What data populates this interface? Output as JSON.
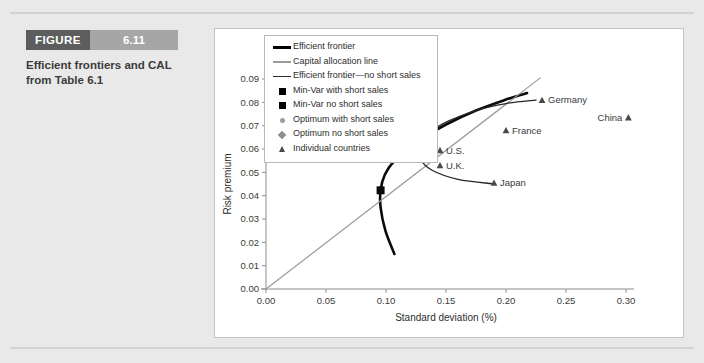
{
  "figure": {
    "banner_label": "FIGURE",
    "banner_number": "6.11",
    "caption": "Efficient frontiers and CAL from Table 6.1"
  },
  "chart_data": {
    "type": "scatter",
    "title": "",
    "xlabel": "Standard deviation (%)",
    "ylabel": "Risk premium",
    "xlim": [
      0.0,
      0.3
    ],
    "ylim": [
      0.0,
      0.09
    ],
    "xticks": [
      "0.00",
      "0.05",
      "0.10",
      "0.15",
      "0.20",
      "0.25",
      "0.30"
    ],
    "xtick_values": [
      0.0,
      0.05,
      0.1,
      0.15,
      0.2,
      0.25,
      0.3
    ],
    "yticks": [
      "0.00",
      "0.01",
      "0.02",
      "0.03",
      "0.04",
      "0.05",
      "0.06",
      "0.07",
      "0.08",
      "0.09"
    ],
    "ytick_values": [
      0.0,
      0.01,
      0.02,
      0.03,
      0.04,
      0.05,
      0.06,
      0.07,
      0.08,
      0.09
    ],
    "grid": false,
    "legend_position": "upper-left-inside",
    "legend": [
      {
        "label": "Efficient frontier",
        "key": "line-thick",
        "color": "#000000"
      },
      {
        "label": "Capital allocation line",
        "key": "line-thin",
        "color": "#9a9a9a"
      },
      {
        "label": "Efficient frontier—no short sales",
        "key": "line-mid",
        "color": "#2b2b2b"
      },
      {
        "label": "Min-Var with short sales",
        "key": "square",
        "color": "#000000"
      },
      {
        "label": "Min-Var no short sales",
        "key": "square",
        "color": "#000000"
      },
      {
        "label": "Optimum with short sales",
        "key": "circle",
        "color": "#9e9e9e"
      },
      {
        "label": "Optimum no short sales",
        "key": "diamond",
        "color": "#8e8e8e"
      },
      {
        "label": "Individual countries",
        "key": "triangle",
        "color": "#4a4a4a"
      }
    ],
    "series": [
      {
        "name": "Individual countries",
        "marker": "triangle",
        "points": [
          {
            "label": "U.S.",
            "x": 0.145,
            "y": 0.0595,
            "label_side": "right"
          },
          {
            "label": "U.K.",
            "x": 0.145,
            "y": 0.053,
            "label_side": "right"
          },
          {
            "label": "Japan",
            "x": 0.19,
            "y": 0.0455,
            "label_side": "right"
          },
          {
            "label": "France",
            "x": 0.2,
            "y": 0.068,
            "label_side": "right"
          },
          {
            "label": "Germany",
            "x": 0.23,
            "y": 0.081,
            "label_side": "right"
          },
          {
            "label": "China",
            "x": 0.302,
            "y": 0.0735,
            "label_side": "left"
          }
        ]
      },
      {
        "name": "Min-Var with short sales",
        "marker": "square",
        "points": [
          {
            "label": "",
            "x": 0.0955,
            "y": 0.0423
          }
        ]
      },
      {
        "name": "Min-Var no short sales",
        "marker": "square",
        "points": [
          {
            "label": "",
            "x": 0.1265,
            "y": 0.0558
          }
        ]
      },
      {
        "name": "Optimum with short sales",
        "marker": "circle",
        "points": [
          {
            "label": "",
            "x": 0.1255,
            "y": 0.06
          }
        ]
      },
      {
        "name": "Optimum no short sales",
        "marker": "diamond",
        "points": [
          {
            "label": "",
            "x": 0.1285,
            "y": 0.0608
          }
        ]
      }
    ],
    "curves": [
      {
        "name": "Efficient frontier",
        "style": "thick-black",
        "points": [
          [
            0.107,
            0.015
          ],
          [
            0.0995,
            0.025
          ],
          [
            0.0955,
            0.035
          ],
          [
            0.0955,
            0.0423
          ],
          [
            0.099,
            0.049
          ],
          [
            0.107,
            0.055
          ],
          [
            0.118,
            0.06
          ],
          [
            0.13,
            0.0645
          ],
          [
            0.15,
            0.0705
          ],
          [
            0.175,
            0.0765
          ],
          [
            0.2,
            0.0812
          ],
          [
            0.2175,
            0.084
          ]
        ]
      },
      {
        "name": "Capital allocation line",
        "style": "thin-gray",
        "points": [
          [
            0.0,
            0.0
          ],
          [
            0.2285,
            0.0905
          ]
        ]
      },
      {
        "name": "Efficient frontier—no short sales",
        "style": "mid-dark",
        "points": [
          [
            0.1905,
            0.045
          ],
          [
            0.16,
            0.047
          ],
          [
            0.138,
            0.051
          ],
          [
            0.128,
            0.056
          ],
          [
            0.1265,
            0.06
          ],
          [
            0.132,
            0.065
          ],
          [
            0.148,
            0.071
          ],
          [
            0.175,
            0.0765
          ],
          [
            0.2,
            0.0795
          ],
          [
            0.225,
            0.081
          ]
        ]
      }
    ]
  }
}
